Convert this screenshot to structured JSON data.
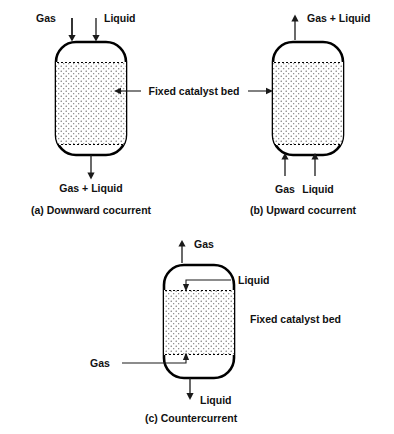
{
  "figure": {
    "colors": {
      "background": "#ffffff",
      "outline": "#000000",
      "text": "#111111",
      "arrow": "#1a1a1a",
      "bed_fill": "#ffffff",
      "bed_stipple": "#5a5a5a"
    }
  },
  "panels": [
    {
      "id": "a",
      "caption": "(a) Downward cocurrent",
      "bed_label": "Fixed catalyst bed",
      "inlets": [
        {
          "name": "gas-inlet",
          "label": "Gas",
          "direction": "down",
          "position": "top-left"
        },
        {
          "name": "liquid-inlet",
          "label": "Liquid",
          "direction": "down",
          "position": "top-right"
        }
      ],
      "outlets": [
        {
          "name": "mixed-outlet",
          "label": "Gas + Liquid",
          "direction": "down",
          "position": "bottom-center"
        }
      ]
    },
    {
      "id": "b",
      "caption": "(b) Upward cocurrent",
      "bed_label": "Fixed catalyst bed",
      "inlets": [
        {
          "name": "gas-inlet",
          "label": "Gas",
          "direction": "up",
          "position": "bottom-left"
        },
        {
          "name": "liquid-inlet",
          "label": "Liquid",
          "direction": "up",
          "position": "bottom-right"
        }
      ],
      "outlets": [
        {
          "name": "mixed-outlet",
          "label": "Gas + Liquid",
          "direction": "up",
          "position": "top-center"
        }
      ]
    },
    {
      "id": "c",
      "caption": "(c) Countercurrent",
      "bed_label": "Fixed catalyst bed",
      "inlets": [
        {
          "name": "liquid-inlet",
          "label": "Liquid",
          "direction": "down",
          "position": "top-right-lead"
        },
        {
          "name": "gas-inlet",
          "label": "Gas",
          "direction": "up",
          "position": "bottom-left-lead"
        }
      ],
      "outlets": [
        {
          "name": "gas-outlet",
          "label": "Gas",
          "direction": "up",
          "position": "top-center"
        },
        {
          "name": "liquid-outlet",
          "label": "Liquid",
          "direction": "down",
          "position": "bottom-center"
        }
      ]
    }
  ],
  "labels": {
    "gas": "Gas",
    "liquid": "Liquid",
    "gas_plus_liquid": "Gas + Liquid",
    "fixed_catalyst_bed": "Fixed catalyst bed",
    "caption_a": "(a) Downward cocurrent",
    "caption_b": "(b) Upward cocurrent",
    "caption_c": "(c) Countercurrent"
  }
}
